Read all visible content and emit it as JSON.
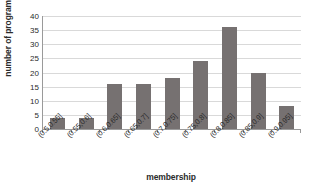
{
  "chart_data": {
    "type": "bar",
    "title": "",
    "xlabel": "membership",
    "ylabel": "number of programs",
    "categories": [
      "(0.5,0.55]",
      "(0.55,0.6]",
      "(0.6,0.65]",
      "(0.65,0.7]",
      "(0.7,0.75]",
      "(0.75,0.8]",
      "(0.8,0.85]",
      "(0.85,0.9]",
      "(0.9,0.95]"
    ],
    "values": [
      4,
      4,
      16,
      16,
      18,
      24,
      36,
      20,
      8
    ],
    "ylim": [
      0,
      40
    ],
    "yticks": [
      0,
      5,
      10,
      15,
      20,
      25,
      30,
      35,
      40
    ],
    "ytick_labels": [
      "0",
      "5",
      "10",
      "15",
      "20",
      "25",
      "30",
      "35",
      "40"
    ],
    "grid": true,
    "legend": false,
    "bar_color": "#767171",
    "gridline_color": "#d9d9d9",
    "axis_color": "#9a9a9a",
    "text_color": "#2b2b2b",
    "background": "#ffffff"
  }
}
